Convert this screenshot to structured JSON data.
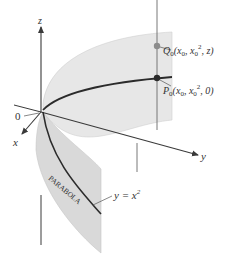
{
  "diagram": {
    "axes": {
      "z_label": "z",
      "x_label": "x",
      "y_label": "y",
      "origin_label": "0"
    },
    "points": {
      "Q": {
        "name": "Q",
        "sub": "0",
        "coords_prefix": "(x",
        "coords_mid": ", x",
        "coords_sup": "2",
        "coords_suffix": ", z)",
        "color": "#8c8c8c"
      },
      "P": {
        "name": "P",
        "sub": "0",
        "coords_prefix": "(x",
        "coords_mid": ", x",
        "coords_sup": "2",
        "coords_suffix": ", 0)",
        "color": "#2a2a2a"
      }
    },
    "curve_label": {
      "lhs": "y = x",
      "sup": "2"
    },
    "surface_label": "PARABOLA",
    "colors": {
      "surface": "#e6e6e6",
      "surface_edge": "#cfcfcf",
      "axis": "#3a3a3a",
      "curve": "#2b2b2b"
    }
  }
}
